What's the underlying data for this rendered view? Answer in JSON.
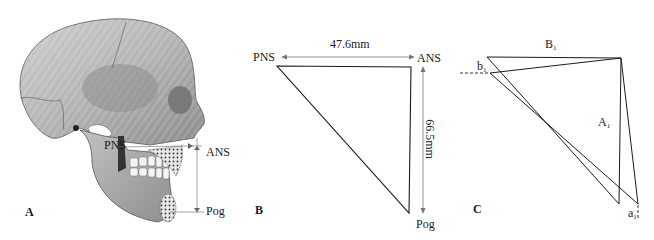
{
  "figure": {
    "panels": [
      {
        "id": "A",
        "letter": "A",
        "description": "Lateral view illustration of skull with cephalometric landmarks",
        "landmarks": {
          "pns": "PNS",
          "ans": "ANS",
          "pog": "Pog"
        }
      },
      {
        "id": "B",
        "letter": "B",
        "description": "Triangle formed by PNS, ANS and Pog landmarks",
        "landmarks": {
          "pns": "PNS",
          "ans": "ANS",
          "pog": "Pog"
        },
        "measurements": {
          "horizontal": "47.6mm",
          "vertical": "66.5mm"
        }
      },
      {
        "id": "C",
        "letter": "C",
        "description": "Superimposed triangles showing changes",
        "labels": {
          "B1": {
            "main": "B",
            "sub": "1"
          },
          "b1": {
            "main": "b",
            "sub": "1"
          },
          "A1": {
            "main": "A",
            "sub": "1"
          },
          "a1": {
            "main": "a",
            "sub": "1"
          }
        }
      }
    ]
  },
  "colors": {
    "line": "#1a1a1a",
    "arrow": "#777777",
    "bone_light": "#d9d9d9",
    "bone_mid": "#a8a8a8",
    "bone_dark": "#5a5a5a"
  }
}
